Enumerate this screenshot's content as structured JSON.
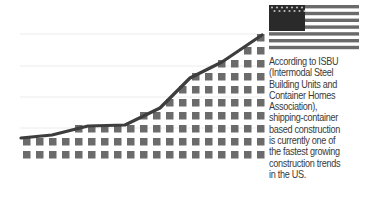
{
  "chart_data": {
    "type": "area",
    "title": "",
    "xlabel": "",
    "ylabel": "",
    "grid": true,
    "gridlines_y_px": [
      34,
      66,
      97,
      128
    ],
    "style": "pictogram square grid under a growth line",
    "categories": [
      "1",
      "2",
      "3",
      "4",
      "5",
      "6",
      "7",
      "8",
      "9",
      "10",
      "11",
      "12",
      "13",
      "14",
      "15",
      "16",
      "17",
      "18",
      "19"
    ],
    "values": [
      2,
      2,
      2,
      2,
      3,
      3,
      3,
      3,
      3,
      4,
      4,
      5,
      6,
      7,
      7,
      8,
      8,
      9,
      10
    ],
    "ylim": [
      0,
      10
    ],
    "line_points": [
      [
        21,
        138
      ],
      [
        52,
        135
      ],
      [
        88,
        126
      ],
      [
        125,
        125
      ],
      [
        160,
        108
      ],
      [
        190,
        78
      ],
      [
        222,
        62
      ],
      [
        262,
        35
      ]
    ],
    "series": [
      {
        "name": "Shipping-container construction growth",
        "values": [
          2,
          2,
          2,
          2,
          3,
          3,
          3,
          3,
          3,
          4,
          4,
          5,
          6,
          7,
          7,
          8,
          8,
          9,
          10
        ]
      }
    ],
    "annotations": [
      "US flag icon",
      "According to ISBU (Intermodal Steel Building Units and Container Homes Association), shipping-container based construction is currently one of the fastest growing construction trends in the US."
    ]
  },
  "colors": {
    "square": "#6b6b6b",
    "line": "#3d3d3d",
    "grid": "#ececec",
    "flag_dark": "#2a2a2a",
    "flag_stripe": "#6a6a6a",
    "text": "#3a3a3a"
  },
  "flag": {
    "icon": "us-flag-icon"
  },
  "caption": {
    "lines": [
      "According to ISBU",
      "(Intermodal Steel",
      "Building Units and",
      "Container Homes",
      "Association),",
      "shipping-container",
      "based construction",
      "is currently one of",
      "the fastest growing",
      "construction trends",
      "in the US."
    ]
  }
}
